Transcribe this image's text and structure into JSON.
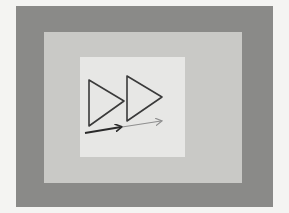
{
  "scene": {
    "description": "Photograph of nested gray squares with two outlined play-style triangles and two arrows",
    "colors": {
      "background": "#f4f4f2",
      "outer_frame": "#8a8a88",
      "middle_panel": "#c9c9c6",
      "inner_panel": "#e7e7e5",
      "triangle_stroke": "#3a3a3a",
      "arrow_dark": "#2a2a2a",
      "arrow_light": "#8e8e8e"
    },
    "shapes": {
      "triangle_left": "89,80 89,126 124,101",
      "triangle_right": "127,76 127,121 162,97"
    },
    "arrows": [
      {
        "name": "dark-arrow",
        "x1": 85,
        "y1": 133,
        "x2": 121,
        "y2": 127
      },
      {
        "name": "light-arrow",
        "x1": 122,
        "y1": 127,
        "x2": 161,
        "y2": 121
      }
    ]
  }
}
